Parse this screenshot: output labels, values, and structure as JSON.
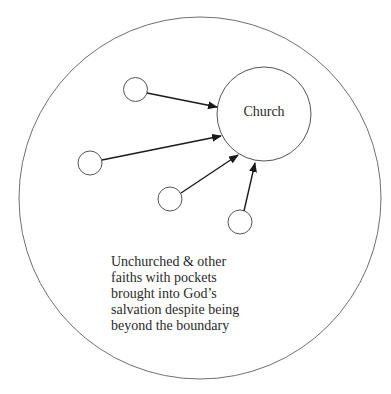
{
  "diagram": {
    "title": "",
    "outer_boundary": {
      "label": "",
      "cx": 200,
      "cy": 198,
      "r": 181
    },
    "church": {
      "label": "Church",
      "cx": 264,
      "cy": 114,
      "r": 47
    },
    "nodes": [
      {
        "id": "node-1",
        "cx": 135.5,
        "cy": 89.5,
        "r": 12
      },
      {
        "id": "node-2",
        "cx": 90,
        "cy": 163,
        "r": 12
      },
      {
        "id": "node-3",
        "cx": 170,
        "cy": 199,
        "r": 12
      },
      {
        "id": "node-4",
        "cx": 240,
        "cy": 222,
        "r": 12
      }
    ],
    "arrows": [
      {
        "from": "node-1",
        "to": "church",
        "x1": 147,
        "y1": 93,
        "x2": 217,
        "y2": 107
      },
      {
        "from": "node-2",
        "to": "church",
        "x1": 102,
        "y1": 160,
        "x2": 221,
        "y2": 136
      },
      {
        "from": "node-3",
        "to": "church",
        "x1": 181,
        "y1": 193,
        "x2": 238,
        "y2": 155
      },
      {
        "from": "node-4",
        "to": "church",
        "x1": 244,
        "y1": 211,
        "x2": 255,
        "y2": 163
      }
    ],
    "caption": {
      "lines": [
        "Unchurched & other",
        "faiths with pockets",
        "brought into God’s",
        "salvation despite being",
        "beyond the boundary"
      ]
    },
    "colors": {
      "stroke": "#555555",
      "arrow": "#1a1a1a",
      "text": "#2a2a2a",
      "background": "#ffffff"
    }
  }
}
